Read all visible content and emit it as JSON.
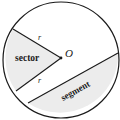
{
  "diagram": {
    "type": "circle-sector-segment",
    "labels": {
      "center": "O",
      "radius_top": "r",
      "radius_bottom": "r",
      "sector": "sector",
      "segment": "segment"
    },
    "colors": {
      "stroke": "#1a1a1a",
      "shade": "#ececec",
      "background": "#ffffff"
    }
  }
}
